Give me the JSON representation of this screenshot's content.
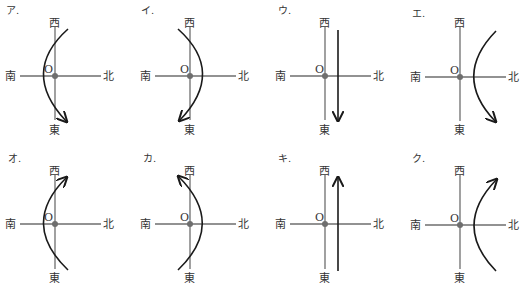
{
  "directions": {
    "north": "北",
    "south": "南",
    "east": "東",
    "west": "西",
    "origin": "O"
  },
  "colors": {
    "axis": "#6e6e6e",
    "path": "#1a1a1a",
    "background": "#ffffff"
  },
  "panels": [
    {
      "label": "ア.",
      "path_type": "arc",
      "bulge": "south",
      "direction": "west-to-east"
    },
    {
      "label": "イ.",
      "path_type": "arc",
      "bulge": "north",
      "direction": "west-to-east"
    },
    {
      "label": "ウ.",
      "path_type": "straight",
      "side": "north",
      "direction": "west-to-east"
    },
    {
      "label": "エ.",
      "path_type": "arc",
      "side": "north",
      "bulge": "south",
      "direction": "west-to-east"
    },
    {
      "label": "オ.",
      "path_type": "arc",
      "bulge": "south",
      "direction": "east-to-west"
    },
    {
      "label": "カ.",
      "path_type": "arc",
      "bulge": "north",
      "direction": "east-to-west"
    },
    {
      "label": "キ.",
      "path_type": "straight",
      "side": "north",
      "direction": "east-to-west"
    },
    {
      "label": "ク.",
      "path_type": "arc",
      "side": "north",
      "bulge": "south",
      "direction": "east-to-west"
    }
  ]
}
